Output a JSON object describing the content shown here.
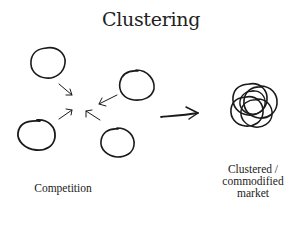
{
  "title": "Clustering",
  "left_group": {
    "label": "Competition",
    "circles": 4,
    "arrows": 4
  },
  "transition_arrow": "right-arrow",
  "right_group": {
    "label_lines": [
      "Clustered /",
      "commodified",
      "market"
    ]
  },
  "colors": {
    "ink": "#1a1a1a",
    "background": "#ffffff"
  }
}
